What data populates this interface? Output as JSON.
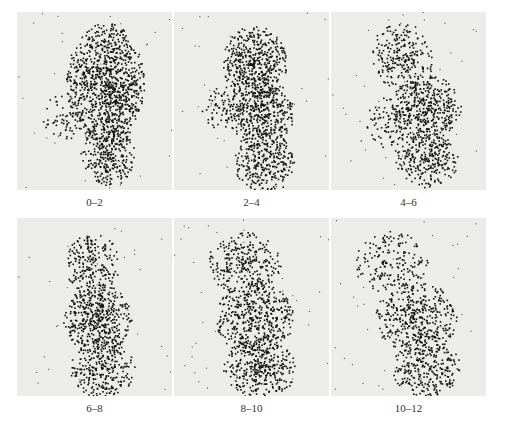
{
  "figure": {
    "panels": [
      {
        "label": "0–2",
        "x": 17,
        "y": 12,
        "blobs": [
          [
            88,
            70,
            34,
            52,
            1.0
          ],
          [
            90,
            140,
            24,
            30,
            0.85
          ],
          [
            45,
            105,
            18,
            20,
            0.6
          ]
        ]
      },
      {
        "label": "2–4",
        "x": 174,
        "y": 12,
        "blobs": [
          [
            80,
            50,
            28,
            32,
            0.95
          ],
          [
            85,
            100,
            30,
            30,
            0.95
          ],
          [
            48,
            95,
            18,
            20,
            0.6
          ],
          [
            90,
            150,
            26,
            28,
            0.85
          ]
        ]
      },
      {
        "label": "4–6",
        "x": 331,
        "y": 12,
        "blobs": [
          [
            70,
            45,
            28,
            30,
            0.75
          ],
          [
            95,
            95,
            30,
            28,
            0.95
          ],
          [
            55,
            110,
            18,
            22,
            0.6
          ],
          [
            95,
            145,
            28,
            26,
            0.85
          ]
        ]
      },
      {
        "label": "6–8",
        "x": 17,
        "y": 218,
        "blobs": [
          [
            75,
            45,
            24,
            26,
            0.8
          ],
          [
            80,
            100,
            30,
            30,
            0.95
          ],
          [
            85,
            150,
            28,
            26,
            0.85
          ]
        ]
      },
      {
        "label": "8–10",
        "x": 174,
        "y": 218,
        "blobs": [
          [
            70,
            45,
            32,
            28,
            0.75
          ],
          [
            80,
            100,
            34,
            32,
            0.9
          ],
          [
            85,
            150,
            32,
            26,
            0.85
          ]
        ]
      },
      {
        "label": "10–12",
        "x": 331,
        "y": 218,
        "blobs": [
          [
            60,
            45,
            32,
            28,
            0.6
          ],
          [
            85,
            100,
            36,
            32,
            0.8
          ],
          [
            95,
            150,
            30,
            24,
            0.8
          ]
        ]
      }
    ]
  }
}
